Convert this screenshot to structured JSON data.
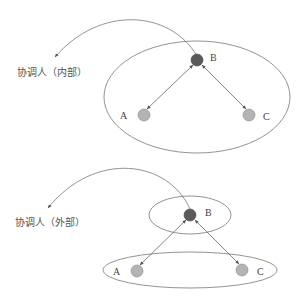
{
  "diagrams": [
    {
      "name": "internal",
      "coordinator_label": "协调人（内部）",
      "nodes": [
        {
          "id": "B",
          "label": "B",
          "role": "coordinator",
          "color": "#5a5a5a"
        },
        {
          "id": "A",
          "label": "A",
          "role": "member",
          "color": "#b4b4b4"
        },
        {
          "id": "C",
          "label": "C",
          "role": "member",
          "color": "#b4b4b4"
        }
      ],
      "groups": [
        {
          "members": [
            "A",
            "B",
            "C"
          ]
        }
      ],
      "edges": [
        {
          "from": "B",
          "to": "A",
          "bidirectional": true
        },
        {
          "from": "B",
          "to": "C",
          "bidirectional": true
        }
      ]
    },
    {
      "name": "external",
      "coordinator_label": "协调人（外部）",
      "nodes": [
        {
          "id": "B",
          "label": "B",
          "role": "coordinator",
          "color": "#5a5a5a"
        },
        {
          "id": "A",
          "label": "A",
          "role": "member",
          "color": "#b4b4b4"
        },
        {
          "id": "C",
          "label": "C",
          "role": "member",
          "color": "#b4b4b4"
        }
      ],
      "groups": [
        {
          "members": [
            "B"
          ]
        },
        {
          "members": [
            "A",
            "C"
          ]
        }
      ],
      "edges": [
        {
          "from": "B",
          "to": "A",
          "bidirectional": true
        },
        {
          "from": "B",
          "to": "C",
          "bidirectional": true
        }
      ]
    }
  ],
  "colors": {
    "line": "#6e6e6e",
    "coordinator_node": "#5a5a5a",
    "member_node": "#b4b4b4",
    "text": "#555555"
  }
}
